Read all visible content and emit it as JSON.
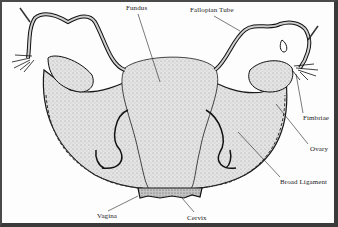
{
  "figure": {
    "colors": {
      "border": "#3a3a3a",
      "ink": "#1a1a1a",
      "tissue": "#d9d9d9",
      "background": "#ffffff"
    }
  },
  "labels": [
    {
      "id": "fundus",
      "text": "Fundus",
      "x": 126,
      "y": 5
    },
    {
      "id": "fallopian-tube",
      "text": "Fallopian Tube",
      "x": 190,
      "y": 7
    },
    {
      "id": "fimbriae",
      "text": "Fimbriae",
      "x": 303,
      "y": 115
    },
    {
      "id": "ovary",
      "text": "Ovary",
      "x": 310,
      "y": 146
    },
    {
      "id": "broad-ligament",
      "text": "Broad Ligament",
      "x": 280,
      "y": 179
    },
    {
      "id": "vagina",
      "text": "Vagina",
      "x": 97,
      "y": 213
    },
    {
      "id": "cervix",
      "text": "Cervix",
      "x": 187,
      "y": 215
    }
  ]
}
